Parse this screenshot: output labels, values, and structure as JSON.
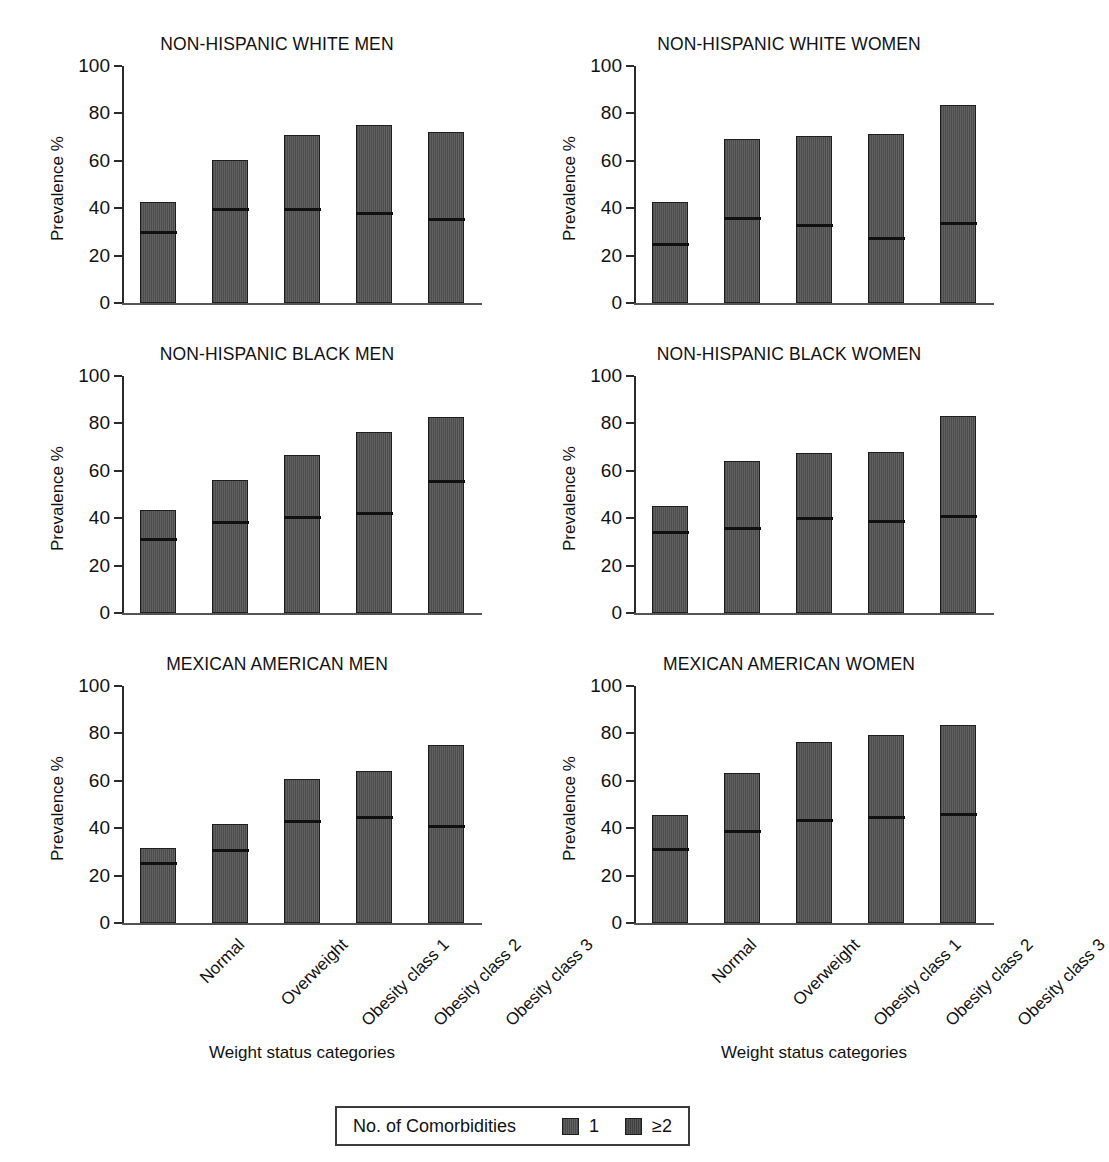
{
  "figure": {
    "panel_titles": [
      "NON-HISPANIC WHITE MEN",
      "NON-HISPANIC WHITE WOMEN",
      "NON-HISPANIC BLACK MEN",
      "NON-HISPANIC BLACK WOMEN",
      "MEXICAN AMERICAN MEN",
      "MEXICAN AMERICAN WOMEN"
    ],
    "ylabel": "Prevalence %",
    "xlabel": "Weight status categories",
    "ytick_labels": [
      "0",
      "20",
      "40",
      "60",
      "80",
      "100"
    ],
    "categories": [
      "Normal",
      "Overweight",
      "Obesity class 1",
      "Obesity class 2",
      "Obesity class 3"
    ],
    "legend": {
      "title": "No. of Comorbidities",
      "entries": [
        {
          "label": "1",
          "swatch": "one-comorbidity-swatch"
        },
        {
          "label": "≥2",
          "swatch": "two-or-more-comorbidities-swatch"
        }
      ]
    },
    "colors": {
      "bar_fill": "#5a5a5a",
      "bar_outline": "#1f1f1f",
      "divider": "#111111",
      "axis": "#2a2a2a",
      "text": "#111111"
    }
  },
  "chart_data": {
    "type": "bar",
    "subtype": "stacked-bar-small-multiples",
    "xlabel": "Weight status categories",
    "ylabel": "Prevalence %",
    "ylim": [
      0,
      100
    ],
    "yticks": [
      0,
      20,
      40,
      60,
      80,
      100
    ],
    "grid": false,
    "legend_position": "bottom-center",
    "categories": [
      "Normal",
      "Overweight",
      "Obesity class 1",
      "Obesity class 2",
      "Obesity class 3"
    ],
    "series_names": [
      "1",
      "≥2"
    ],
    "panels": [
      {
        "title": "NON-HISPANIC WHITE MEN",
        "totals": [
          42.5,
          60.5,
          71.0,
          75.2,
          72.0
        ],
        "series": [
          {
            "name": "1",
            "values": [
              29.5,
              39.0,
              39.2,
              37.2,
              34.7
            ]
          },
          {
            "name": "≥2",
            "values": [
              13.0,
              21.5,
              31.8,
              38.0,
              37.3
            ]
          }
        ]
      },
      {
        "title": "NON-HISPANIC WHITE WOMEN",
        "totals": [
          42.5,
          69.0,
          70.5,
          71.2,
          83.7
        ],
        "series": [
          {
            "name": "1",
            "values": [
              24.3,
              35.3,
              32.2,
              26.6,
              33.0
            ]
          },
          {
            "name": "≥2",
            "values": [
              18.2,
              33.7,
              38.3,
              44.6,
              50.7
            ]
          }
        ]
      },
      {
        "title": "NON-HISPANIC BLACK MEN",
        "totals": [
          43.4,
          56.0,
          66.6,
          76.3,
          82.7
        ],
        "series": [
          {
            "name": "1",
            "values": [
              30.7,
              37.6,
              40.0,
              41.5,
              55.2
            ]
          },
          {
            "name": "≥2",
            "values": [
              12.7,
              18.4,
              26.6,
              34.8,
              27.5
            ]
          }
        ]
      },
      {
        "title": "NON-HISPANIC BLACK WOMEN",
        "totals": [
          45.2,
          64.2,
          67.5,
          68.0,
          83.1
        ],
        "series": [
          {
            "name": "1",
            "values": [
              33.7,
              35.4,
              39.3,
              38.3,
              40.4
            ]
          },
          {
            "name": "≥2",
            "values": [
              11.5,
              28.8,
              28.2,
              29.7,
              42.7
            ]
          }
        ]
      },
      {
        "title": "MEXICAN AMERICAN MEN",
        "totals": [
          31.6,
          41.9,
          60.6,
          64.2,
          75.2
        ],
        "series": [
          {
            "name": "1",
            "values": [
              24.5,
              30.0,
              42.3,
              44.1,
              40.1
            ]
          },
          {
            "name": "≥2",
            "values": [
              7.1,
              11.9,
              18.3,
              20.1,
              35.1
            ]
          }
        ]
      },
      {
        "title": "MEXICAN AMERICAN WOMEN",
        "totals": [
          45.4,
          63.4,
          76.3,
          79.3,
          83.6
        ],
        "series": [
          {
            "name": "1",
            "values": [
              30.6,
              38.4,
              42.7,
              44.2,
              45.2
            ]
          },
          {
            "name": "≥2",
            "values": [
              14.8,
              25.0,
              33.6,
              35.1,
              38.4
            ]
          }
        ]
      }
    ]
  }
}
